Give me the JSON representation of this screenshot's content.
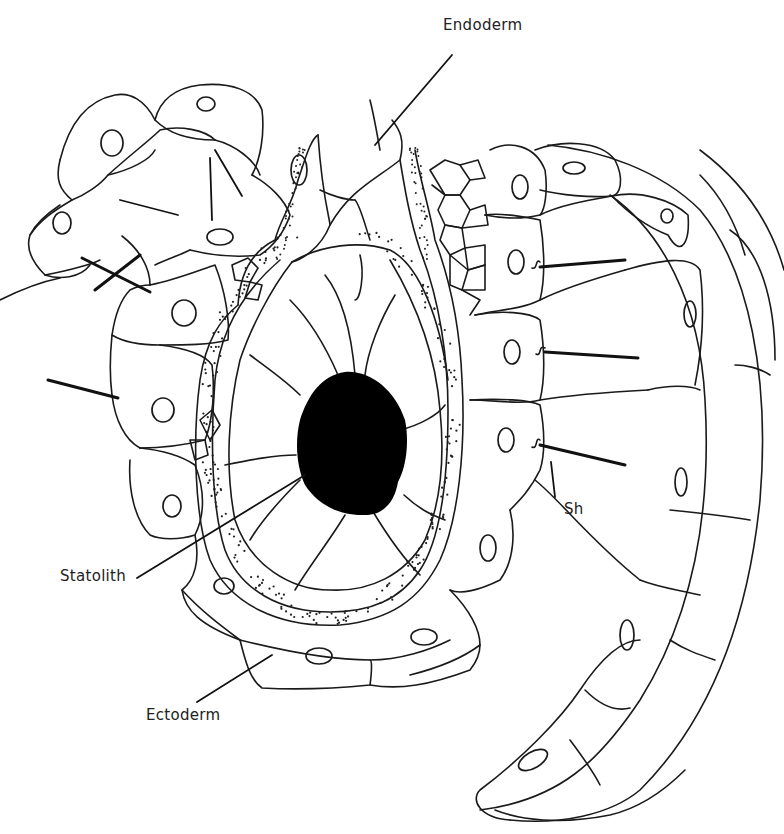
{
  "figure": {
    "type": "biological line drawing",
    "colors": {
      "ink": "#1a1a1a",
      "background": "#ffffff",
      "statolith_fill": "#000000"
    }
  },
  "labels": {
    "endoderm": "Endoderm",
    "statolith": "Statolith",
    "ectoderm": "Ectoderm",
    "sh": "Sh"
  }
}
